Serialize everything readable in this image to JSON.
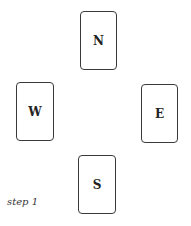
{
  "cards": {
    "north": "N",
    "west": "W",
    "east": "E",
    "south": "S"
  },
  "caption": "step 1"
}
